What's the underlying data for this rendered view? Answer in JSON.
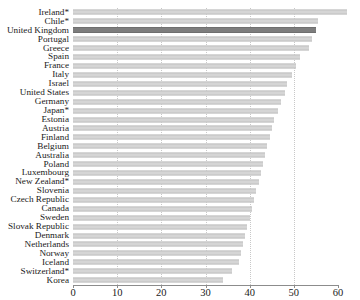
{
  "chart_data": {
    "type": "bar",
    "orientation": "horizontal",
    "title": "",
    "subtitle": "",
    "xlabel": "",
    "ylabel": "",
    "xlim": [
      0,
      60
    ],
    "xticks": [
      0,
      10,
      20,
      30,
      40,
      50,
      60
    ],
    "xtick_labels": [
      "0",
      "10",
      "20",
      "30",
      "40",
      "50",
      "60"
    ],
    "grid": true,
    "gridlines_at": [
      10,
      20,
      30,
      40,
      50
    ],
    "legend": null,
    "highlight_category": "United Kingdom",
    "colors": {
      "bar": "#d5d5d5",
      "bar_edge": "#c2c2c2",
      "highlight_bar": "#7d7d7d",
      "highlight_edge": "#6f6f6f",
      "grid": "#c8c8c8",
      "axis": "#8c8c8c",
      "text": "#1a1a1a",
      "background": "#ffffff"
    },
    "categories": [
      "Ireland*",
      "Chile*",
      "United Kingdom",
      "Portugal",
      "Greece",
      "Spain",
      "France",
      "Italy",
      "Israel",
      "United States",
      "Germany",
      "Japan*",
      "Estonia",
      "Austria",
      "Finland",
      "Belgium",
      "Australia",
      "Poland",
      "Luxembourg",
      "New Zealand*",
      "Slovenia",
      "Czech Republic",
      "Canada",
      "Sweden",
      "Slovak Republic",
      "Denmark",
      "Netherlands",
      "Norway",
      "Iceland",
      "Switzerland*",
      "Korea"
    ],
    "values": [
      62.0,
      55.5,
      55.0,
      54.0,
      53.5,
      51.5,
      50.5,
      49.5,
      48.5,
      48.0,
      47.0,
      46.5,
      45.5,
      45.0,
      44.5,
      44.0,
      43.5,
      43.0,
      42.5,
      42.0,
      41.5,
      41.0,
      40.5,
      40.0,
      39.5,
      39.0,
      38.5,
      38.0,
      37.5,
      36.0,
      34.0
    ]
  }
}
